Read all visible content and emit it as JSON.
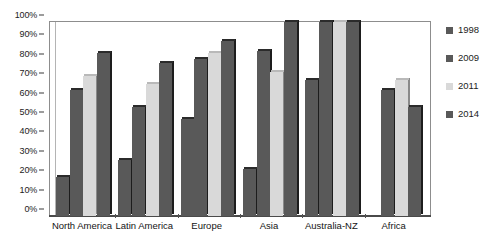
{
  "chart_data": {
    "type": "bar",
    "title": "",
    "subtitle": "",
    "xlabel": "",
    "ylabel": "",
    "ylim": [
      0,
      100
    ],
    "y_unit": "%",
    "grid": false,
    "legend_position": "right",
    "orientation": "vertical",
    "grouping": "grouped",
    "categories": [
      "North America",
      "Latin America",
      "Europe",
      "Asia",
      "Australia-NZ",
      "Africa"
    ],
    "y_ticks": [
      "0%",
      "10%",
      "20%",
      "30%",
      "40%",
      "50%",
      "60%",
      "70%",
      "80%",
      "90%",
      "100%"
    ],
    "y_tick_values": [
      0,
      10,
      20,
      30,
      40,
      50,
      60,
      70,
      80,
      90,
      100
    ],
    "series": [
      {
        "name": "1998",
        "color": "#595959",
        "values": [
          20,
          29,
          50,
          24,
          70,
          null
        ]
      },
      {
        "name": "2009",
        "color": "#595959",
        "values": [
          65,
          56,
          81,
          85,
          100,
          65
        ]
      },
      {
        "name": "2011",
        "color": "#d9d9d9",
        "values": [
          72,
          68,
          84,
          74,
          100,
          70
        ]
      },
      {
        "name": "2014",
        "color": "#595959",
        "values": [
          84,
          79,
          90,
          100,
          100,
          56
        ]
      }
    ]
  },
  "legend": {
    "entries": [
      {
        "label": "1998",
        "color": "#595959"
      },
      {
        "label": "2009",
        "color": "#595959"
      },
      {
        "label": "2011",
        "color": "#d9d9d9"
      },
      {
        "label": "2014",
        "color": "#595959"
      }
    ]
  },
  "colors": {
    "dark_bar": "#595959",
    "light_bar": "#d9d9d9",
    "bar_edge": "#1d1d1d",
    "axis": "#4a4a4a",
    "frame": "#8d8d8d",
    "background": "#ffffff",
    "text": "#1a1a1a"
  }
}
